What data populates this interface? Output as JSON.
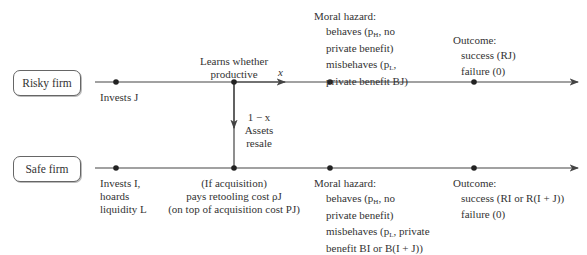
{
  "risky": {
    "label": "Risky firm",
    "invests": "Invests J",
    "learns_line1": "Learns whether",
    "learns_line2": "productive",
    "branch_x": "x",
    "branch_1mx": "1 − x",
    "assets_line1": "Assets",
    "assets_line2": "resale",
    "moral_hazard_title": "Moral hazard:",
    "behaves_line1": "behaves (p",
    "behaves_sub": "H",
    "behaves_line1_end": ", no",
    "behaves_line2": "private benefit)",
    "misbehaves_line1": "misbehaves (p",
    "misbehaves_sub": "L",
    "misbehaves_line1_end": ",",
    "misbehaves_line2": "private benefit BJ)",
    "outcome_title": "Outcome:",
    "success": "success (RJ)",
    "failure": "failure (0)"
  },
  "safe": {
    "label": "Safe firm",
    "invests_line1": "Invests I,",
    "invests_line2": "hoards",
    "invests_line3": "liquidity L",
    "acq_line1": "(If acquisition)",
    "acq_line2": "pays retooling cost ρJ",
    "acq_line3": "(on top of acquisition cost PJ)",
    "moral_hazard_title": "Moral hazard:",
    "behaves_line1": "behaves (p",
    "behaves_sub": "H",
    "behaves_line1_end": ", no",
    "behaves_line2": "private benefit)",
    "misbehaves_line1": "misbehaves (p",
    "misbehaves_sub": "L",
    "misbehaves_line1_end": ", private",
    "misbehaves_line2": "benefit BI or B(I + J))",
    "outcome_title": "Outcome:",
    "success": "success (RI or R(I + J))",
    "failure": "failure (0)"
  },
  "colors": {
    "line": "#444444",
    "text": "#333333",
    "box_border": "#666666"
  }
}
